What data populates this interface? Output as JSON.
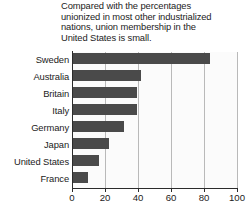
{
  "chart_data": {
    "type": "bar",
    "orientation": "horizontal",
    "title": "Compared with the percentages\nunionized in most other industrialized\nnations, union membership in the\nUnited States is small.",
    "categories": [
      "Sweden",
      "Australia",
      "Britain",
      "Italy",
      "Germany",
      "Japan",
      "United States",
      "France"
    ],
    "values": [
      83,
      41,
      39,
      39,
      31,
      22,
      16,
      9
    ],
    "series": [
      {
        "name": "Union membership",
        "values": [
          83,
          41,
          39,
          39,
          31,
          22,
          16,
          9
        ]
      }
    ],
    "xlabel": "",
    "ylabel": "",
    "xlim": [
      0,
      100
    ],
    "xticks": [
      0,
      20,
      40,
      60,
      80,
      100
    ],
    "xtick_labels": [
      "0",
      "20",
      "40",
      "60",
      "80",
      "100"
    ],
    "grid": true,
    "legend": false,
    "bar_color": "#4a4a4a",
    "plot_background": "#fbfbfb",
    "axis_color": "#2b2b2b",
    "gridline_color": "#b9b9b9",
    "text_color": "#1b1b1b"
  }
}
